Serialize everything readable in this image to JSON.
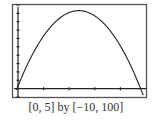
{
  "caption": "[0, 5] by [−10, 100]",
  "chart_data": {
    "type": "line",
    "title": "",
    "xlabel": "",
    "ylabel": "",
    "xlim": [
      0,
      5
    ],
    "ylim": [
      -10,
      100
    ],
    "xscale_ticks": 1,
    "yscale_ticks": 10,
    "grid": false,
    "series": [
      {
        "name": "parabola",
        "function": "y = -16x^2 + 76x + 3 (approx.)",
        "x": [
          0,
          0.5,
          1,
          1.5,
          2,
          2.375,
          2.5,
          3,
          3.5,
          4,
          4.5,
          4.8
        ],
        "y": [
          3,
          37,
          63,
          81,
          91,
          93,
          93,
          87,
          73,
          51,
          21,
          0
        ]
      }
    ]
  }
}
